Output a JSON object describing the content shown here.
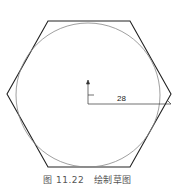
{
  "figure": {
    "caption": "图 11.22　绘制草图",
    "dimension_value": "28",
    "shapes": {
      "hexagon": "regular hexagon with flat top/bottom edges",
      "circle": "inscribed construction circle",
      "dimension": "horizontal radius dimension from center to right vertex"
    },
    "colors": {
      "hexagon_stroke": "#222222",
      "circle_stroke": "#888888",
      "dimension_stroke": "#333333"
    }
  }
}
